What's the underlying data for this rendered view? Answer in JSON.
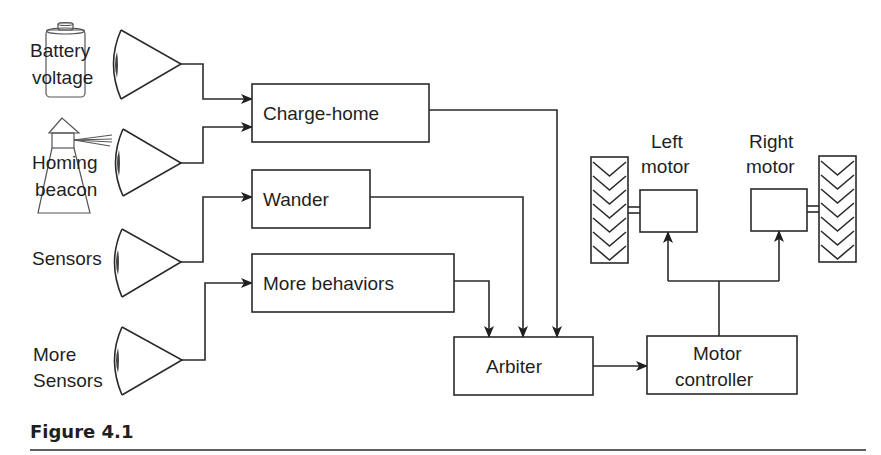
{
  "figure": {
    "caption": "Figure 4.1"
  },
  "sensors": [
    {
      "id": "battery",
      "label_line1": "Battery",
      "label_line2": "voltage",
      "icon": "battery-icon"
    },
    {
      "id": "beacon",
      "label_line1": "Homing",
      "label_line2": "beacon",
      "icon": "lighthouse-icon"
    },
    {
      "id": "sensors",
      "label_line1": "Sensors",
      "label_line2": "",
      "icon": "eye-icon"
    },
    {
      "id": "more-sensors",
      "label_line1": "More",
      "label_line2": "Sensors",
      "icon": "eye-icon"
    }
  ],
  "behaviors": [
    {
      "id": "charge-home",
      "label": "Charge-home"
    },
    {
      "id": "wander",
      "label": "Wander"
    },
    {
      "id": "more-behaviors",
      "label": "More behaviors"
    }
  ],
  "arbiter": {
    "label": "Arbiter"
  },
  "motor_controller": {
    "label_line1": "Motor",
    "label_line2": "controller"
  },
  "motors": [
    {
      "id": "left",
      "label_line1": "Left",
      "label_line2": "motor"
    },
    {
      "id": "right",
      "label_line1": "Right",
      "label_line2": "motor"
    }
  ],
  "connections": [
    {
      "from": "Battery voltage",
      "to": "Charge-home"
    },
    {
      "from": "Homing beacon",
      "to": "Charge-home"
    },
    {
      "from": "Sensors",
      "to": "Wander"
    },
    {
      "from": "More Sensors",
      "to": "More behaviors"
    },
    {
      "from": "Charge-home",
      "to": "Arbiter"
    },
    {
      "from": "Wander",
      "to": "Arbiter"
    },
    {
      "from": "More behaviors",
      "to": "Arbiter"
    },
    {
      "from": "Arbiter",
      "to": "Motor controller"
    },
    {
      "from": "Motor controller",
      "to": "Left motor"
    },
    {
      "from": "Motor controller",
      "to": "Right motor"
    }
  ]
}
